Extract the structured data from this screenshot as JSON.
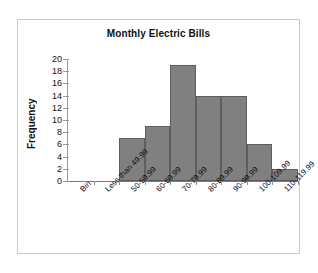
{
  "chart_data": {
    "type": "bar",
    "title": "Monthly Electric Bills",
    "xlabel": "",
    "ylabel": "Frequency",
    "categories": [
      "Bin",
      "Less than 49.99",
      "50-59.99",
      "60-69.99",
      "70-79.99",
      "80-89.99",
      "90-99.99",
      "100-109.99",
      "110-119.99"
    ],
    "values": [
      0,
      0,
      7,
      9,
      19,
      14,
      14,
      6,
      2
    ],
    "ylim": [
      0,
      20
    ],
    "ytick_labels": [
      "0",
      "2",
      "4",
      "6",
      "8",
      "10",
      "12",
      "14",
      "16",
      "18",
      "20"
    ],
    "ytick_values": [
      0,
      2,
      4,
      6,
      8,
      10,
      12,
      14,
      16,
      18,
      20
    ],
    "grid": false,
    "legend": "none",
    "bar_color": "#808080",
    "bar_border_color": "#5e5e5e",
    "axis_color": "#8f8f8f",
    "frame_color": "#c8c8c8",
    "text_color": "#111111"
  }
}
